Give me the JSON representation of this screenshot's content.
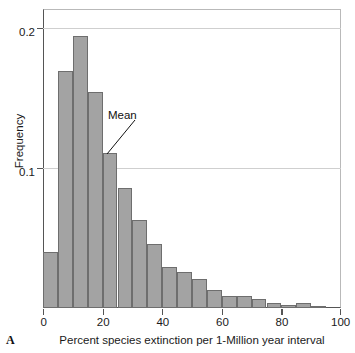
{
  "panel": {
    "letter": "A"
  },
  "axes": {
    "ylabel": "Frequency",
    "xlabel": "Percent species extinction per 1-Million year interval",
    "ytick_labels": [
      "0.2",
      "0.1"
    ],
    "xtick_labels": [
      "0",
      "20",
      "40",
      "60",
      "80",
      "100"
    ]
  },
  "annotations": {
    "mean_label": "Mean"
  },
  "colors": {
    "bar_fill": "#a3a3a3",
    "bar_stroke": "#6e6e6e",
    "axis": "#555555",
    "gridline": "#cfcfcf",
    "text": "#1a1a1a"
  },
  "chart_data": {
    "type": "bar",
    "title": "",
    "subtitle": "",
    "xlabel": "Percent species extinction per 1-Million year interval",
    "ylabel": "Frequency",
    "xlim": [
      0,
      100
    ],
    "ylim": [
      0,
      0.2135
    ],
    "xticks": [
      0,
      20,
      40,
      60,
      80,
      100
    ],
    "yticks": [
      0.1,
      0.2
    ],
    "grid": "horizontal",
    "legend": "none",
    "bin_width": 5,
    "bin_starts": [
      0,
      5,
      10,
      15,
      20,
      25,
      30,
      35,
      40,
      45,
      50,
      55,
      60,
      65,
      70,
      75,
      80,
      85,
      90,
      95
    ],
    "categories": [
      "0-5",
      "5-10",
      "10-15",
      "15-20",
      "20-25",
      "25-30",
      "30-35",
      "35-40",
      "40-45",
      "45-50",
      "50-55",
      "55-60",
      "60-65",
      "65-70",
      "70-75",
      "75-80",
      "80-85",
      "85-90",
      "90-95",
      "95-100"
    ],
    "values": [
      0.04,
      0.169,
      0.194,
      0.154,
      0.111,
      0.086,
      0.063,
      0.046,
      0.029,
      0.026,
      0.021,
      0.013,
      0.0086,
      0.0086,
      0.0064,
      0.0036,
      0.0021,
      0.0036,
      0.0007,
      0.0
    ],
    "annotations": [
      {
        "text": "Mean",
        "points_to_x": 20,
        "points_to_y": 0.111
      }
    ]
  }
}
